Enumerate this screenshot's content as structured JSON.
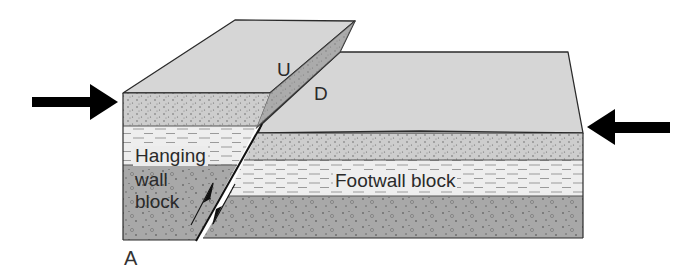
{
  "diagram": {
    "panel_label": "A",
    "labels": {
      "upthrown": "U",
      "downthrown": "D",
      "hanging_wall_line1": "Hanging",
      "hanging_wall_line2": "wall",
      "hanging_wall_line3": "block",
      "footwall": "Footwall block"
    },
    "forces": [
      {
        "name": "compression-left",
        "direction": "right"
      },
      {
        "name": "compression-right",
        "direction": "left"
      }
    ],
    "layers": [
      {
        "name": "sandstone",
        "pattern": "fine-dots",
        "color": "#cfcfcf"
      },
      {
        "name": "shale",
        "pattern": "dashes",
        "color": "#eeeeee"
      },
      {
        "name": "conglomerate",
        "pattern": "dots-and-pebbles",
        "color": "#a9a9a9"
      }
    ],
    "colors": {
      "top_surface": "#d6d6d6",
      "fault_scarp": "#9c9c9c",
      "outline": "#2b2b2b",
      "arrow": "#000000"
    }
  }
}
